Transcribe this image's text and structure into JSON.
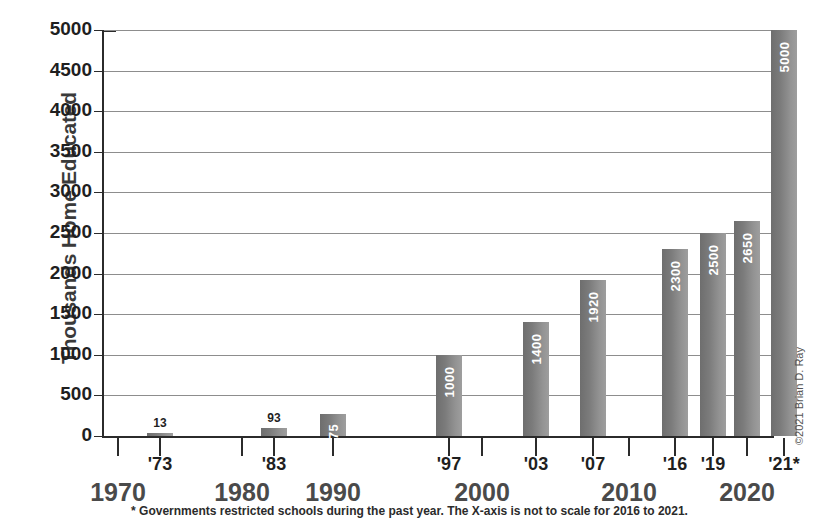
{
  "chart_data": {
    "type": "bar",
    "title": "",
    "xlabel": "",
    "ylabel": "Thousands Home Educated",
    "ylim": [
      0,
      5000
    ],
    "ytick_step": 500,
    "grid": true,
    "legend": null,
    "categories": [
      "'73",
      "'83",
      "1990",
      "'97",
      "'03",
      "'07",
      "'16",
      "'19",
      "2020",
      "'21*"
    ],
    "values": [
      13,
      93,
      275,
      1000,
      1400,
      1920,
      2300,
      2500,
      2650,
      5000
    ],
    "ytick_labels": [
      "5000",
      "4500",
      "4000",
      "3500",
      "3000",
      "2500",
      "2000",
      "1500",
      "1000",
      "500",
      "0"
    ],
    "x_major_labels": [
      "1970",
      "1980",
      "1990",
      "2000",
      "2010",
      "2020"
    ],
    "x_minor_labels": [
      "'73",
      "'83",
      "'97",
      "'03",
      "'07",
      "'16",
      "'19",
      "'21*"
    ],
    "annotations": [
      "* Governments restricted schools during the past year. The X-axis is not to scale for 2016 to 2021."
    ],
    "bars": [
      {
        "label": "'73",
        "value": 13,
        "value_text": "13",
        "x_center": 58,
        "width": 26,
        "label_placement": "above"
      },
      {
        "label": "'83",
        "value": 93,
        "value_text": "93",
        "x_center": 172,
        "width": 26,
        "label_placement": "above"
      },
      {
        "label": "1990",
        "value": 275,
        "value_text": "275",
        "x_center": 231,
        "width": 26,
        "label_placement": "inside"
      },
      {
        "label": "'97",
        "value": 1000,
        "value_text": "1000",
        "x_center": 347,
        "width": 26,
        "label_placement": "inside"
      },
      {
        "label": "'03",
        "value": 1400,
        "value_text": "1400",
        "x_center": 434,
        "width": 26,
        "label_placement": "inside"
      },
      {
        "label": "'07",
        "value": 1920,
        "value_text": "1920",
        "x_center": 491,
        "width": 26,
        "label_placement": "inside"
      },
      {
        "label": "'16",
        "value": 2300,
        "value_text": "2300",
        "x_center": 573,
        "width": 26,
        "label_placement": "inside"
      },
      {
        "label": "'19",
        "value": 2500,
        "value_text": "2500",
        "x_center": 611,
        "width": 26,
        "label_placement": "inside"
      },
      {
        "label": "2020",
        "value": 2650,
        "value_text": "2650",
        "x_center": 645,
        "width": 26,
        "label_placement": "inside"
      },
      {
        "label": "'21*",
        "value": 5000,
        "value_text": "5000",
        "x_center": 682,
        "width": 26,
        "label_placement": "inside"
      }
    ],
    "x_ticks": [
      {
        "text": "1970",
        "type": "major",
        "x": 16
      },
      {
        "text": "'73",
        "type": "minor",
        "x": 58
      },
      {
        "text": "1980",
        "type": "major",
        "x": 140
      },
      {
        "text": "'83",
        "type": "minor",
        "x": 172
      },
      {
        "text": "1990",
        "type": "major",
        "x": 231
      },
      {
        "text": "2000",
        "type": "major",
        "x": 380
      },
      {
        "text": "'97",
        "type": "minor",
        "x": 347
      },
      {
        "text": "'03",
        "type": "minor",
        "x": 434
      },
      {
        "text": "'07",
        "type": "minor",
        "x": 491
      },
      {
        "text": "2010",
        "type": "major",
        "x": 527
      },
      {
        "text": "'16",
        "type": "minor",
        "x": 573
      },
      {
        "text": "'19",
        "type": "minor",
        "x": 611
      },
      {
        "text": "2020",
        "type": "major",
        "x": 645
      },
      {
        "text": "'21*",
        "type": "minor",
        "x": 682
      }
    ]
  },
  "axis": {
    "y_title": "Thousands Home Educated"
  },
  "footnote": {
    "text": "* Governments restricted schools during the past year. The X-axis is not to scale for 2016 to 2021."
  },
  "copyright": {
    "text": "©2021 Brian D. Ray"
  },
  "colors": {
    "bar_dark": "#6e6e6e",
    "bar_light": "#9e9e9e",
    "axis": "#2b2b2b",
    "grid": "#8d8d8d",
    "major_label": "#4a4a4a",
    "background": "#ffffff"
  }
}
